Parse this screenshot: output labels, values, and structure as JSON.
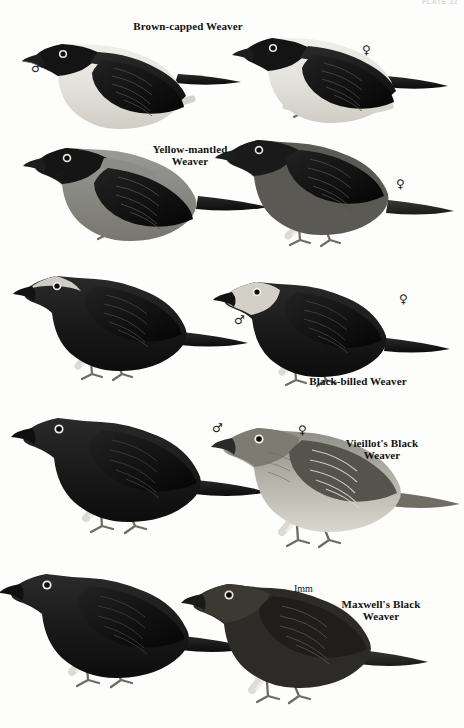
{
  "plate": {
    "number": "PLATE 32",
    "background_color": "#fdfdfc",
    "ink_color": "#111111"
  },
  "species": [
    {
      "id": "brown-capped-weaver",
      "label": "Brown-capped Weaver",
      "label_lines": 1,
      "row": 1,
      "figures": [
        {
          "sex_symbol": "♂",
          "sex_name": "male",
          "plumage": "black-hood-pale-underparts"
        },
        {
          "sex_symbol": "♀",
          "sex_name": "female",
          "plumage": "black-hood-pale-underparts"
        }
      ]
    },
    {
      "id": "yellow-mantled-weaver",
      "label": "Yellow-mantled\nWeaver",
      "label_lines": 2,
      "row": 2,
      "figures": [
        {
          "sex_symbol": "♂",
          "sex_name": "male",
          "plumage": "black-head-grey-mantle"
        },
        {
          "sex_symbol": "♀",
          "sex_name": "female",
          "plumage": "dark-overall"
        }
      ]
    },
    {
      "id": "black-billed-weaver",
      "label": "Black-billed Weaver",
      "label_lines": 1,
      "row": 3,
      "figures": [
        {
          "sex_symbol": "♂",
          "sex_name": "male",
          "plumage": "black-pale-crown"
        },
        {
          "sex_symbol": "♀",
          "sex_name": "female",
          "plumage": "black-pale-face"
        }
      ]
    },
    {
      "id": "vieillots-black-weaver",
      "label": "Vieillot's Black\nWeaver",
      "label_lines": 2,
      "row": 4,
      "figures": [
        {
          "sex_symbol": "♂",
          "sex_name": "male",
          "plumage": "all-black"
        },
        {
          "sex_symbol": "♀",
          "sex_name": "female",
          "plumage": "streaked-olive-pale-below"
        }
      ]
    },
    {
      "id": "maxwells-black-weaver",
      "label": "Maxwell's Black\nWeaver",
      "label_lines": 2,
      "row": 5,
      "figures": [
        {
          "sex_symbol": "♂",
          "sex_name": "male",
          "plumage": "all-black"
        },
        {
          "sex_symbol": "Imm",
          "sex_name": "immature",
          "plumage": "dull-black-brownish"
        }
      ]
    }
  ],
  "labels": {
    "brown_capped": "Brown-capped Weaver",
    "yellow_mantled": "Yellow-mantled\nWeaver",
    "black_billed": "Black-billed Weaver",
    "vieillots": "Vieillot's Black\nWeaver",
    "maxwells": "Maxwell's Black\nWeaver",
    "immature": "Imm"
  },
  "symbols": {
    "male": "♂",
    "female": "♀"
  }
}
